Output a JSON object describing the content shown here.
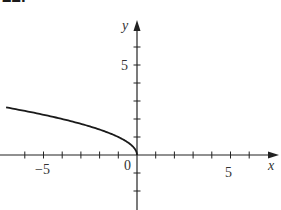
{
  "problem_number": "22.",
  "chart_data": {
    "type": "line",
    "title": "",
    "xlabel": "x",
    "ylabel": "y",
    "function": "y = sqrt(-x)",
    "x": [
      -7,
      -6,
      -5,
      -4,
      -3,
      -2,
      -1,
      -0.5,
      -0.1,
      0
    ],
    "y": [
      2.65,
      2.45,
      2.24,
      2.0,
      1.73,
      1.41,
      1.0,
      0.71,
      0.32,
      0
    ],
    "xlim": [
      -7.3,
      7.5
    ],
    "ylim": [
      -3,
      7.4
    ],
    "x_ticks": [
      -6,
      -5,
      -4,
      -3,
      -2,
      -1,
      1,
      2,
      3,
      4,
      5,
      6
    ],
    "y_ticks": [
      -2,
      -1,
      1,
      2,
      3,
      4,
      5,
      6
    ],
    "x_tick_labels": [
      "-5",
      "5"
    ],
    "y_tick_labels": [
      "5"
    ],
    "origin_label": "0",
    "grid": false,
    "legend": null
  },
  "labels": {
    "x_axis": "x",
    "y_axis": "y",
    "origin": "0",
    "x_neg5": "−5",
    "x_pos5": "5",
    "y_pos5": "5"
  },
  "colors": {
    "axis": "#222222",
    "curve": "#1a1a1a",
    "text": "#333333"
  }
}
